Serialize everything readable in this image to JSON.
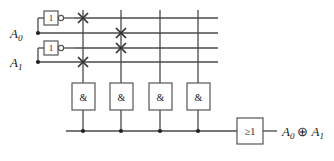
{
  "diagram": {
    "inputs": [
      {
        "id": "A0",
        "label": "A",
        "subscript": "0"
      },
      {
        "id": "A1",
        "label": "A",
        "subscript": "1"
      }
    ],
    "inverters": [
      {
        "id": "inv-a0",
        "symbol": "1",
        "input": "A0",
        "output": "not-A0"
      },
      {
        "id": "inv-a1",
        "symbol": "1",
        "input": "A1",
        "output": "not-A1"
      }
    ],
    "bus_rows": [
      {
        "index": 0,
        "signal": "not-A0"
      },
      {
        "index": 1,
        "signal": "A0"
      },
      {
        "index": 2,
        "signal": "not-A1"
      },
      {
        "index": 3,
        "signal": "A1"
      }
    ],
    "and_gates": [
      {
        "id": "and-1",
        "symbol": "&",
        "connections": [
          0,
          3
        ]
      },
      {
        "id": "and-2",
        "symbol": "&",
        "connections": [
          1,
          2
        ]
      },
      {
        "id": "and-3",
        "symbol": "&",
        "connections": []
      },
      {
        "id": "and-4",
        "symbol": "&",
        "connections": []
      }
    ],
    "or_gate": {
      "id": "or-1",
      "symbol": "≥1"
    },
    "output": {
      "label": "A",
      "sub1": "0",
      "operator": "⊕",
      "label2": "A",
      "sub2": "1"
    },
    "colors": {
      "wire": "#4a4a4a",
      "gate_border": "#555555",
      "text": "#1a1a1a",
      "background": "#ffffff"
    }
  }
}
